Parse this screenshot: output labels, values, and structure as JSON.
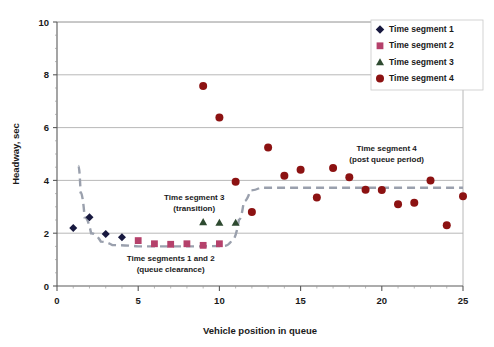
{
  "chart_data": {
    "type": "scatter",
    "title": "",
    "xlabel": "Vehicle position in queue",
    "ylabel": "Headway, sec",
    "xlim": [
      0,
      25
    ],
    "ylim": [
      0,
      10
    ],
    "xticks": [
      0,
      5,
      10,
      15,
      20,
      25
    ],
    "yticks": [
      0,
      2,
      4,
      6,
      8,
      10
    ],
    "x_minor_tick_step": 1,
    "grid": "horizontal-major-only",
    "legend_position": "top-right",
    "series": [
      {
        "name": "Time segment 1",
        "marker": "diamond",
        "color": "#18193f",
        "points": [
          {
            "x": 1,
            "y": 2.2
          },
          {
            "x": 2,
            "y": 2.6
          },
          {
            "x": 3,
            "y": 1.97
          },
          {
            "x": 4,
            "y": 1.85
          }
        ]
      },
      {
        "name": "Time segment 2",
        "marker": "square",
        "color": "#b5416b",
        "points": [
          {
            "x": 5,
            "y": 1.72
          },
          {
            "x": 6,
            "y": 1.6
          },
          {
            "x": 7,
            "y": 1.58
          },
          {
            "x": 8,
            "y": 1.6
          },
          {
            "x": 9,
            "y": 1.54
          },
          {
            "x": 10,
            "y": 1.6
          }
        ]
      },
      {
        "name": "Time segment 3",
        "marker": "triangle",
        "color": "#2e4a30",
        "points": [
          {
            "x": 9,
            "y": 2.42
          },
          {
            "x": 10,
            "y": 2.4
          },
          {
            "x": 11,
            "y": 2.4
          }
        ]
      },
      {
        "name": "Time segment 4",
        "marker": "circle",
        "color": "#8c1212",
        "points": [
          {
            "x": 9,
            "y": 7.58
          },
          {
            "x": 10,
            "y": 6.38
          },
          {
            "x": 11,
            "y": 3.95
          },
          {
            "x": 12,
            "y": 2.8
          },
          {
            "x": 13,
            "y": 5.25
          },
          {
            "x": 14,
            "y": 4.18
          },
          {
            "x": 15,
            "y": 4.4
          },
          {
            "x": 16,
            "y": 3.35
          },
          {
            "x": 17,
            "y": 4.47
          },
          {
            "x": 18,
            "y": 4.12
          },
          {
            "x": 19,
            "y": 3.65
          },
          {
            "x": 20,
            "y": 3.64
          },
          {
            "x": 21,
            "y": 3.1
          },
          {
            "x": 22,
            "y": 3.15
          },
          {
            "x": 23,
            "y": 4.0
          },
          {
            "x": 24,
            "y": 2.3
          },
          {
            "x": 25,
            "y": 3.4
          }
        ]
      }
    ],
    "trend_line": {
      "style": "dashed",
      "color": "#9aa0ad",
      "points": [
        {
          "x": 1.32,
          "y": 4.55
        },
        {
          "x": 1.45,
          "y": 3.55
        },
        {
          "x": 1.7,
          "y": 2.6
        },
        {
          "x": 2.1,
          "y": 2.0
        },
        {
          "x": 2.7,
          "y": 1.68
        },
        {
          "x": 3.4,
          "y": 1.55
        },
        {
          "x": 5.0,
          "y": 1.5
        },
        {
          "x": 8.0,
          "y": 1.5
        },
        {
          "x": 10.3,
          "y": 1.52
        },
        {
          "x": 10.8,
          "y": 1.75
        },
        {
          "x": 11.2,
          "y": 2.5
        },
        {
          "x": 11.5,
          "y": 3.2
        },
        {
          "x": 11.9,
          "y": 3.62
        },
        {
          "x": 12.5,
          "y": 3.72
        },
        {
          "x": 25.0,
          "y": 3.72
        }
      ]
    },
    "annotations": [
      {
        "name": "segment-12-annotation",
        "lines": [
          "Time segments 1 and 2",
          "(queue clearance)"
        ],
        "x": 7.0,
        "y": 0.95
      },
      {
        "name": "segment-3-annotation",
        "lines": [
          "Time segment 3",
          "(transition)"
        ],
        "x": 8.45,
        "y": 3.25
      },
      {
        "name": "segment-4-annotation",
        "lines": [
          "Time segment 4",
          "(post queue period)"
        ],
        "x": 20.3,
        "y": 5.1
      }
    ]
  },
  "legend": {
    "items": [
      {
        "label": "Time segment 1",
        "marker": "diamond",
        "color": "#18193f"
      },
      {
        "label": "Time segment 2",
        "marker": "square",
        "color": "#b5416b"
      },
      {
        "label": "Time segment 3",
        "marker": "triangle",
        "color": "#2e4a30"
      },
      {
        "label": "Time segment 4",
        "marker": "circle",
        "color": "#8c1212"
      }
    ]
  },
  "axis": {
    "x_title": "Vehicle position in queue",
    "y_title": "Headway, sec",
    "x_tick_labels": [
      "0",
      "5",
      "10",
      "15",
      "20",
      "25"
    ],
    "y_tick_labels": [
      "0",
      "2",
      "4",
      "6",
      "8",
      "10"
    ]
  },
  "colors": {
    "grid": "#b0b0b0",
    "axis": "#5a5a5a",
    "trend": "#9aa0ad",
    "text": "#1a1a1a",
    "plot_background": "#ffffff"
  }
}
